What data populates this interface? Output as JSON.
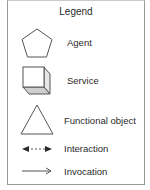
{
  "legend": {
    "title": "Legend",
    "items": [
      {
        "icon": "pentagon-icon",
        "label": "Agent"
      },
      {
        "icon": "cube-icon",
        "label": "Service"
      },
      {
        "icon": "triangle-icon",
        "label": "Functional object"
      },
      {
        "icon": "dashed-double-arrow-icon",
        "label": "Interaction"
      },
      {
        "icon": "open-arrow-icon",
        "label": "Invocation"
      }
    ]
  },
  "colors": {
    "stroke": "#4a4a4a",
    "cube_side": "#e6e6e6",
    "cube_bottom": "#cfcfcf",
    "border": "#9a9a9a",
    "text": "#2a2a2a"
  }
}
